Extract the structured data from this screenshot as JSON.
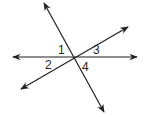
{
  "figure": {
    "line_color": "#231f20",
    "labels": [
      {
        "text": "1",
        "x": 58,
        "y": 45
      },
      {
        "text": "3",
        "x": 93,
        "y": 45
      },
      {
        "text": "2",
        "x": 45,
        "y": 60
      },
      {
        "text": "4",
        "x": 82,
        "y": 62
      }
    ],
    "lines": [
      {
        "name": "horizontal-line",
        "x1": 13,
        "y1": 57,
        "x2": 137,
        "y2": 57
      },
      {
        "name": "steep-line",
        "x1": 44,
        "y1": 3,
        "x2": 104,
        "y2": 112
      },
      {
        "name": "diagonal-line",
        "x1": 21,
        "y1": 89,
        "x2": 128,
        "y2": 27
      }
    ]
  }
}
